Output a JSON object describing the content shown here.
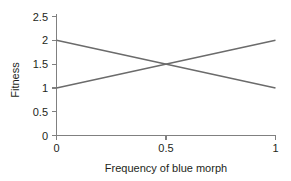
{
  "chart_data": {
    "type": "line",
    "title": "",
    "subtitle": "",
    "xlabel": "Frequency of blue morph",
    "ylabel": "Fitness",
    "xlim": [
      0,
      1
    ],
    "ylim": [
      0,
      2.5
    ],
    "xticks": [
      "0",
      "0.5",
      "1"
    ],
    "xtick_values": [
      0,
      0.5,
      1
    ],
    "yticks": [
      "0",
      "0.5",
      "1",
      "1.5",
      "2",
      "2.5"
    ],
    "ytick_values": [
      0,
      0.5,
      1,
      1.5,
      2,
      2.5
    ],
    "grid": false,
    "legend": "none",
    "annotations": [],
    "x": [
      0,
      1
    ],
    "series": [
      {
        "name": "descending-line",
        "values": [
          2,
          1
        ],
        "color": "#6b6b6b"
      },
      {
        "name": "ascending-line",
        "values": [
          1,
          2
        ],
        "color": "#6b6b6b"
      }
    ],
    "intersection": {
      "x": 0.5,
      "y": 1.5
    },
    "colors": {
      "line": "#6b6b6b",
      "axis": "#808080",
      "text": "#231f20",
      "background": "#ffffff"
    }
  },
  "labels": {
    "y_axis_title": "Fitness",
    "x_axis_title": "Frequency of blue morph",
    "ytick_0": "0",
    "ytick_1": "0.5",
    "ytick_2": "1",
    "ytick_3": "1.5",
    "ytick_4": "2",
    "ytick_5": "2.5",
    "xtick_0": "0",
    "xtick_1": "0.5",
    "xtick_2": "1"
  }
}
